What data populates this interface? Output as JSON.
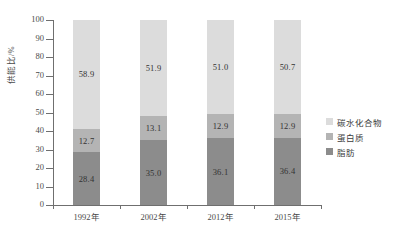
{
  "chart_data": {
    "type": "bar",
    "subtype": "stacked-percentage",
    "title": "",
    "xlabel": "",
    "ylabel": "供能比/%",
    "ylim": [
      0,
      100
    ],
    "yticks": [
      0,
      10,
      20,
      30,
      40,
      50,
      60,
      70,
      80,
      90,
      100
    ],
    "ytick_labels": [
      "0",
      "10",
      "20",
      "30",
      "40",
      "50",
      "60",
      "70",
      "80",
      "90",
      "100"
    ],
    "grid": false,
    "legend_position": "right",
    "categories": [
      "1992年",
      "2002年",
      "2012年",
      "2015年"
    ],
    "series": [
      {
        "name": "脂肪",
        "color": "#8c8c8c",
        "values": [
          28.4,
          35.0,
          36.1,
          36.4
        ],
        "labels": [
          "28.4",
          "35.0",
          "36.1",
          "36.4"
        ]
      },
      {
        "name": "蛋白质",
        "color": "#b4b4b4",
        "values": [
          12.7,
          13.1,
          12.9,
          12.9
        ],
        "labels": [
          "12.7",
          "13.1",
          "12.9",
          "12.9"
        ]
      },
      {
        "name": "碳水化合物",
        "color": "#dcdcdc",
        "values": [
          58.9,
          51.9,
          51.0,
          50.7
        ],
        "labels": [
          "58.9",
          "51.9",
          "51.0",
          "50.7"
        ]
      }
    ]
  },
  "legend": {
    "items": [
      {
        "label": "碳水化合物",
        "color": "#dcdcdc"
      },
      {
        "label": "蛋白质",
        "color": "#b4b4b4"
      },
      {
        "label": "脂肪",
        "color": "#8c8c8c"
      }
    ]
  },
  "colors": {
    "carbohydrate": "#dcdcdc",
    "protein": "#b4b4b4",
    "fat": "#8c8c8c",
    "axis": "#6f6f6f",
    "text": "#3c3c3c",
    "background": "#ffffff"
  }
}
